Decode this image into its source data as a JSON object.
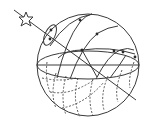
{
  "diagram": {
    "elements": {
      "sphere": {
        "cx": 88,
        "cy": 65,
        "r": 51
      },
      "horizon": {
        "cx": 88,
        "cy": 65,
        "rx": 51,
        "ry": 14
      },
      "axis": {
        "x1": 14,
        "y1": 10,
        "x2": 136,
        "y2": 100
      },
      "star": {
        "cx": 26,
        "cy": 19,
        "label": "star-icon"
      }
    },
    "colors": {
      "line": "#3a3a3a",
      "background": "#ffffff"
    }
  }
}
